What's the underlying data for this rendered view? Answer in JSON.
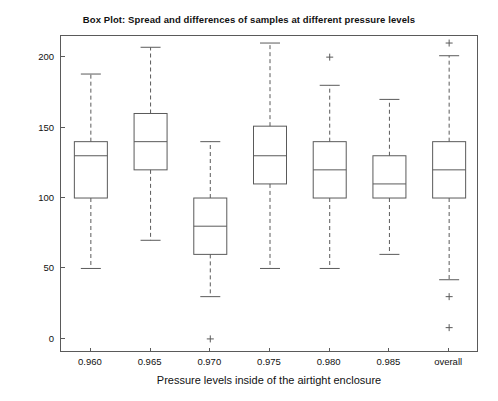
{
  "chart_data": {
    "type": "box",
    "title": "Box Plot: Spread and differences of samples at different pressure levels",
    "xlabel": "Pressure levels inside of the airtight enclosure",
    "ylabel": "Pressure Deviation (ubar)",
    "categories": [
      "0.960",
      "0.965",
      "0.970",
      "0.975",
      "0.980",
      "0.985",
      "overall"
    ],
    "ylim": [
      -10,
      215
    ],
    "yticks": [
      0,
      50,
      100,
      150,
      200
    ],
    "ytick_labels": [
      "0",
      "50",
      "100",
      "150",
      "200"
    ],
    "grid": false,
    "legend": "none",
    "boxes": [
      {
        "category": "0.960",
        "whisker_low": 50,
        "q1": 100,
        "median": 130,
        "q3": 140,
        "whisker_high": 188,
        "outliers": []
      },
      {
        "category": "0.965",
        "whisker_low": 70,
        "q1": 120,
        "median": 140,
        "q3": 160,
        "whisker_high": 207,
        "outliers": []
      },
      {
        "category": "0.970",
        "whisker_low": 30,
        "q1": 60,
        "median": 80,
        "q3": 100,
        "whisker_high": 140,
        "outliers": [
          0
        ]
      },
      {
        "category": "0.975",
        "whisker_low": 50,
        "q1": 110,
        "median": 130,
        "q3": 151,
        "whisker_high": 210,
        "outliers": []
      },
      {
        "category": "0.980",
        "whisker_low": 50,
        "q1": 100,
        "median": 120,
        "q3": 140,
        "whisker_high": 180,
        "outliers": [
          200
        ]
      },
      {
        "category": "0.985",
        "whisker_low": 60,
        "q1": 100,
        "median": 110,
        "q3": 130,
        "whisker_high": 170,
        "outliers": []
      },
      {
        "category": "overall",
        "whisker_low": 42,
        "q1": 100,
        "median": 120,
        "q3": 140,
        "whisker_high": 201,
        "outliers": [
          210,
          30,
          8
        ]
      }
    ],
    "colors": {
      "line": "#5a5a5a",
      "text": "#111111",
      "background": "#ffffff"
    }
  }
}
